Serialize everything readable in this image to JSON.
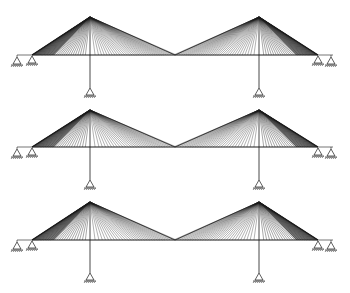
{
  "figure": {
    "background": "#ffffff",
    "line_color": "#1a1a1a",
    "bridges": [
      {
        "id": "bridge-1",
        "deck_y": 55,
        "tower_top_y": 17,
        "pier_foot_y": 88,
        "cable_count": 34
      },
      {
        "id": "bridge-2",
        "deck_y": 147,
        "tower_top_y": 110,
        "pier_foot_y": 180,
        "cable_count": 30
      },
      {
        "id": "bridge-3",
        "deck_y": 240,
        "tower_top_y": 202,
        "pier_foot_y": 273,
        "cable_count": 30
      }
    ],
    "geometry": {
      "deck_left_x": 32,
      "deck_right_x": 318,
      "left_tower_x": 90,
      "right_tower_x": 259,
      "mid_x": 175,
      "end_support_left_x": [
        17,
        32
      ],
      "end_support_right_x": [
        318,
        331
      ]
    }
  }
}
